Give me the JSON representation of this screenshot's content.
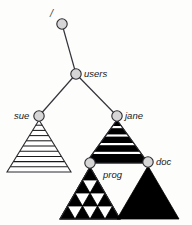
{
  "diagram": {
    "background_color": "#fdfdfc",
    "node_fill_color": "#d6d6d6",
    "node_stroke_color": "#2b2b30",
    "edge_color": "#33333a",
    "triangle_fill_color": "#000000",
    "triangle_outline_color": "#2b2b30",
    "nodes": [
      {
        "id": "root",
        "label": "/",
        "label_side": "left",
        "cx": 62,
        "cy": 24,
        "r": 5.2,
        "label_x": 50,
        "label_y": 17,
        "subtree": "none"
      },
      {
        "id": "users",
        "label": "users",
        "label_side": "right",
        "cx": 76,
        "cy": 74,
        "r": 5.2,
        "label_x": 84,
        "label_y": 77,
        "subtree": "none"
      },
      {
        "id": "sue",
        "label": "sue",
        "label_side": "left",
        "cx": 39,
        "cy": 116,
        "r": 5.2,
        "label_x": 14,
        "label_y": 119,
        "subtree": "striped"
      },
      {
        "id": "jane",
        "label": "jane",
        "label_side": "right",
        "cx": 117,
        "cy": 116,
        "r": 5.2,
        "label_x": 125,
        "label_y": 119,
        "subtree": "banded"
      },
      {
        "id": "prog",
        "label": "prog",
        "label_side": "right",
        "cx": 90,
        "cy": 163,
        "r": 5.2,
        "label_x": 103,
        "label_y": 178,
        "subtree": "sierpinski"
      },
      {
        "id": "doc",
        "label": "doc",
        "label_side": "right",
        "cx": 148,
        "cy": 162,
        "r": 5.2,
        "label_x": 156,
        "label_y": 165,
        "subtree": "solid"
      }
    ],
    "edges": [
      {
        "from": "root",
        "to": "users"
      },
      {
        "from": "users",
        "to": "sue"
      },
      {
        "from": "users",
        "to": "jane"
      }
    ],
    "subtrees": [
      {
        "owner": "sue",
        "style": "striped",
        "description": "white triangle with horizontal black stripes",
        "apex_x": 39,
        "apex_y": 120,
        "base_y": 172,
        "half_width": 32,
        "stripe_count": 9
      },
      {
        "owner": "jane",
        "style": "banded",
        "description": "triangle filled with thick black horizontal bands",
        "apex_x": 117,
        "apex_y": 120,
        "base_y": 163,
        "half_width": 31,
        "band_count": 5
      },
      {
        "owner": "prog",
        "style": "sierpinski",
        "description": "Sierpinski triangle, two subdivision levels",
        "apex_x": 90,
        "apex_y": 167,
        "base_y": 219,
        "half_width": 30,
        "depth": 2
      },
      {
        "owner": "doc",
        "style": "solid",
        "description": "solid black triangle",
        "apex_x": 148,
        "apex_y": 166,
        "base_y": 219,
        "half_width": 31
      }
    ]
  }
}
